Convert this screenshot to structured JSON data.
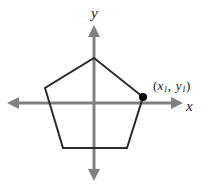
{
  "figure": {
    "width": 205,
    "height": 187,
    "background_color": "#ffffff"
  },
  "axes": {
    "color": "#808080",
    "stroke_width": 3,
    "origin": {
      "x": 94,
      "y": 103
    },
    "x_axis": {
      "label": "x",
      "from": {
        "x": 8,
        "y": 103
      },
      "to": {
        "x": 182,
        "y": 103
      },
      "arrow_start": true,
      "arrow_end": true
    },
    "y_axis": {
      "label": "y",
      "from": {
        "x": 94,
        "y": 26
      },
      "to": {
        "x": 94,
        "y": 180
      },
      "arrow_start": true,
      "arrow_end": true
    }
  },
  "shape": {
    "name": "pentagon",
    "sides": 5,
    "stroke_color": "#2b2b2b",
    "stroke_width": 2,
    "fill": "none",
    "vertices": [
      {
        "name": "top",
        "x": 94,
        "y": 58
      },
      {
        "name": "right",
        "x": 143,
        "y": 97
      },
      {
        "name": "bottom-right",
        "x": 127,
        "y": 148
      },
      {
        "name": "bottom-left",
        "x": 63,
        "y": 148
      },
      {
        "name": "left",
        "x": 45,
        "y": 88
      }
    ]
  },
  "marker": {
    "name": "labeled-vertex",
    "x": 143,
    "y": 97,
    "radius": 4,
    "color": "#000000"
  },
  "labels": {
    "y_axis": "y",
    "x_axis": "x",
    "point": {
      "open_paren": "(",
      "x_var": "x",
      "x_sub": "1",
      "comma": ",",
      "y_var": "y",
      "y_sub": "1",
      "close_paren": ")",
      "full_text": "(x1, y1)"
    }
  },
  "colors": {
    "axis": "#808080",
    "shape_stroke": "#2b2b2b",
    "marker": "#000000",
    "text": "#1a1a1a",
    "background": "#ffffff"
  }
}
